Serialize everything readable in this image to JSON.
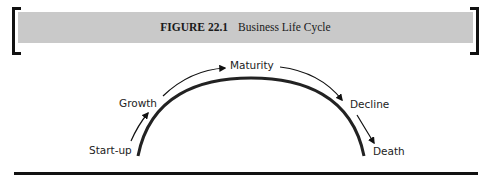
{
  "figure": {
    "number_label": "FIGURE 22.1",
    "caption": "Business Life Cycle"
  },
  "stages": [
    {
      "name": "Start-up"
    },
    {
      "name": "Growth"
    },
    {
      "name": "Maturity"
    },
    {
      "name": "Decline"
    },
    {
      "name": "Death"
    }
  ]
}
